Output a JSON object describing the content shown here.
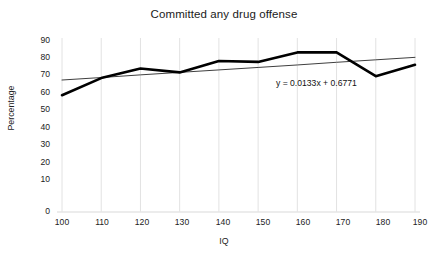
{
  "chart_data": {
    "type": "line",
    "title": "Committed any drug offense",
    "xlabel": "IQ",
    "ylabel": "Percentage",
    "x": [
      100,
      110,
      120,
      130,
      140,
      150,
      160,
      170,
      180,
      190
    ],
    "xticks": [
      "100",
      "110",
      "120",
      "130",
      "140",
      "150",
      "160",
      "170",
      "180",
      "190"
    ],
    "yticks": [
      "0",
      "10",
      "20",
      "30",
      "40",
      "50",
      "60",
      "70",
      "80",
      "90"
    ],
    "xlim": [
      100,
      190
    ],
    "ylim": [
      0,
      90
    ],
    "grid": "vertical-only",
    "legend": "none",
    "series": [
      {
        "name": "Committed any drug offense",
        "values": [
          61,
          70,
          75,
          73,
          79,
          78.5,
          83.5,
          83.5,
          71,
          77
        ],
        "color": "#000000",
        "line_width": 2.6
      }
    ],
    "trendline": {
      "type": "linear",
      "equation": "y = 0.0133x + 0.6771",
      "slope": 0.0133,
      "intercept": 0.6771,
      "values": [
        69,
        70.3,
        71.7,
        73,
        74.3,
        75.6,
        76.9,
        78.3,
        79.6,
        80.9
      ],
      "color": "#3f3f3f",
      "line_width": 1
    },
    "colors": {
      "series": "#000000",
      "trendline": "#3f3f3f",
      "gridline": "#e2e2e2",
      "text": "#222222",
      "background": "#ffffff"
    }
  }
}
